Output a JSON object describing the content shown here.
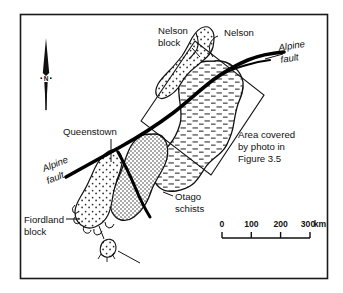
{
  "figure": {
    "type": "geological-map",
    "region": "South Island, New Zealand",
    "frame_color": "#1a1a1a",
    "ink_color": "#111111",
    "background_color": "#ffffff"
  },
  "labels": {
    "nelson_block": "Nelson\nblock",
    "nelson_block_line1": "Nelson",
    "nelson_block_line2": "block",
    "nelson": "Nelson",
    "alpine_fault_ne_line1": "Alpine",
    "alpine_fault_ne_line2": "fault",
    "alpine_fault_sw_line1": "Alpine",
    "alpine_fault_sw_line2": "fault",
    "queenstown": "Queenstown",
    "otago_schists_line1": "Otago",
    "otago_schists_line2": "schists",
    "fiordland_block_line1": "Fiordland",
    "fiordland_block_line2": "block",
    "photo_area_line1": "Area covered",
    "photo_area_line2": "by photo in",
    "photo_area_line3": "Figure 3.5"
  },
  "north_arrow": {
    "label": "N"
  },
  "scale_bar": {
    "ticks": [
      "0",
      "100",
      "200",
      "300"
    ],
    "unit": "km",
    "tick_0": "0",
    "tick_1": "100",
    "tick_2": "200",
    "tick_3": "300",
    "unit_label": "km"
  },
  "legend_patterns": {
    "otago_schists": "dense-stipple",
    "greywacke": "horizontal-dashes",
    "nelson_block": "sparse-stipple",
    "fiordland_block": "sparse-stipple",
    "alpine_fault": "thick-black-line"
  }
}
